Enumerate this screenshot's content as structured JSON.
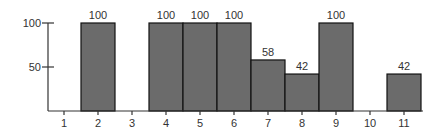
{
  "chart_data": {
    "type": "bar",
    "title": "",
    "xlabel": "",
    "ylabel": "",
    "categories": [
      "1",
      "2",
      "3",
      "4",
      "5",
      "6",
      "7",
      "8",
      "9",
      "10",
      "11"
    ],
    "values": [
      0,
      100,
      0,
      100,
      100,
      100,
      58,
      42,
      100,
      0,
      42
    ],
    "data_labels": [
      "",
      "100",
      "",
      "100",
      "100",
      "100",
      "58",
      "42",
      "100",
      "",
      "42"
    ],
    "y_ticks": [
      50,
      100
    ],
    "ylim": [
      0,
      100
    ],
    "grid": false,
    "legend": null,
    "colors": {
      "bar_fill": "#6b6b6b",
      "bar_stroke": "#111111",
      "axis": "#333333"
    }
  }
}
